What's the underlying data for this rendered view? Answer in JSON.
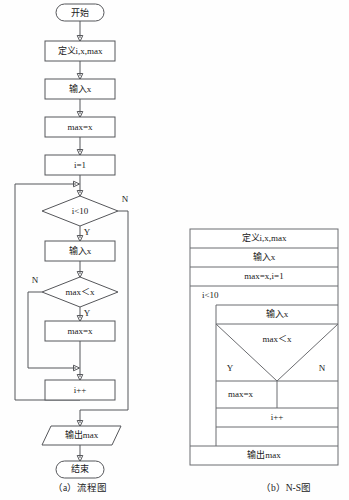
{
  "figure": {
    "background": "#fefefe",
    "line_color": "#55565a",
    "ns_line_color": "#6b6c70",
    "text_color": "#1a1a1a"
  },
  "flowchart": {
    "caption": "（a）流程图",
    "nodes": {
      "start": "开始",
      "declare": "定义i,x,max",
      "input_x_1": "输入x",
      "assign_max": "max=x",
      "assign_i": "i=1",
      "cond_loop": "i<10",
      "input_x_2": "输入x",
      "cond_compare": "max＜x",
      "update_max": "max=x",
      "increment": "i++",
      "output": "输出max",
      "end": "结束"
    },
    "branch_labels": {
      "loop_no": "N",
      "loop_yes": "Y",
      "compare_no": "N",
      "compare_yes": "Y"
    }
  },
  "ns_diagram": {
    "caption": "（b）N-S图",
    "rows": {
      "declare": "定义i,x,max",
      "input_x_1": "输入x",
      "assign": "max=x,i=1",
      "loop_cond": "i<10",
      "input_x_2": "输入x",
      "compare": "max＜x",
      "branch_yes": "Y",
      "branch_no": "N",
      "update_max": "max=x",
      "increment": "i++",
      "output": "输出max"
    }
  }
}
